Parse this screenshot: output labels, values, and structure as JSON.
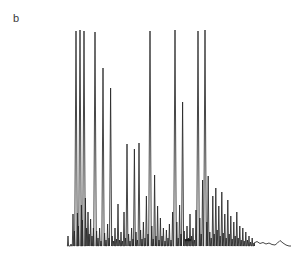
{
  "figure": {
    "panel_label": "b",
    "background_color": "#ffffff",
    "trace_color": "#262626",
    "label_color": "#3a3a3a"
  },
  "chart_data": {
    "type": "line",
    "title": "",
    "subtitle": "",
    "xlabel": "",
    "ylabel": "",
    "tick_labels_x": [],
    "tick_labels_y": [],
    "grid": false,
    "legend": [],
    "legend_position": "none",
    "axis_visible": false,
    "xlim": [
      0,
      294
    ],
    "ylim": [
      0,
      266
    ],
    "baseline_y": 246,
    "plot_left_x": 68,
    "plot_right_x": 291,
    "annotations": [
      {
        "name": "panel-letter",
        "text": "b",
        "x": 13,
        "y": 18
      }
    ],
    "artifacts": [
      {
        "name": "ink-blob",
        "x": 188,
        "y": 240,
        "rx": 3.4,
        "ry": 1.3
      }
    ],
    "peaks": [
      {
        "x": 68.0,
        "top": 236.0
      },
      {
        "x": 71.0,
        "top": 244.0
      },
      {
        "x": 73.0,
        "top": 214.0
      },
      {
        "x": 74.4,
        "top": 231.0
      },
      {
        "x": 76.0,
        "top": 31.0
      },
      {
        "x": 77.4,
        "top": 213.0
      },
      {
        "x": 78.4,
        "top": 226.0
      },
      {
        "x": 80.0,
        "top": 30.0
      },
      {
        "x": 81.4,
        "top": 205.0
      },
      {
        "x": 82.4,
        "top": 220.0
      },
      {
        "x": 84.0,
        "top": 31.0
      },
      {
        "x": 85.4,
        "top": 198.0
      },
      {
        "x": 86.6,
        "top": 228.0
      },
      {
        "x": 88.0,
        "top": 212.0
      },
      {
        "x": 89.2,
        "top": 234.0
      },
      {
        "x": 90.6,
        "top": 219.0
      },
      {
        "x": 92.0,
        "top": 236.0
      },
      {
        "x": 93.4,
        "top": 228.0
      },
      {
        "x": 95.0,
        "top": 32.0
      },
      {
        "x": 96.6,
        "top": 231.0
      },
      {
        "x": 98.0,
        "top": 238.0
      },
      {
        "x": 99.6,
        "top": 228.0
      },
      {
        "x": 101.0,
        "top": 241.0
      },
      {
        "x": 103.0,
        "top": 68.0
      },
      {
        "x": 104.6,
        "top": 233.0
      },
      {
        "x": 106.0,
        "top": 240.0
      },
      {
        "x": 107.6,
        "top": 224.0
      },
      {
        "x": 109.0,
        "top": 238.0
      },
      {
        "x": 110.6,
        "top": 88.0
      },
      {
        "x": 112.2,
        "top": 236.0
      },
      {
        "x": 113.6,
        "top": 241.0
      },
      {
        "x": 115.0,
        "top": 228.0
      },
      {
        "x": 116.6,
        "top": 239.0
      },
      {
        "x": 118.0,
        "top": 204.0
      },
      {
        "x": 119.4,
        "top": 240.0
      },
      {
        "x": 121.0,
        "top": 232.0
      },
      {
        "x": 122.4,
        "top": 241.0
      },
      {
        "x": 124.0,
        "top": 212.0
      },
      {
        "x": 125.6,
        "top": 238.0
      },
      {
        "x": 127.0,
        "top": 144.0
      },
      {
        "x": 128.6,
        "top": 234.0
      },
      {
        "x": 130.0,
        "top": 241.0
      },
      {
        "x": 131.6,
        "top": 228.0
      },
      {
        "x": 133.0,
        "top": 239.0
      },
      {
        "x": 134.4,
        "top": 149.0
      },
      {
        "x": 136.0,
        "top": 232.0
      },
      {
        "x": 137.4,
        "top": 240.0
      },
      {
        "x": 139.0,
        "top": 143.0
      },
      {
        "x": 140.6,
        "top": 230.0
      },
      {
        "x": 142.0,
        "top": 239.0
      },
      {
        "x": 143.4,
        "top": 222.0
      },
      {
        "x": 145.0,
        "top": 238.0
      },
      {
        "x": 146.4,
        "top": 196.0
      },
      {
        "x": 148.0,
        "top": 234.0
      },
      {
        "x": 150.0,
        "top": 31.0
      },
      {
        "x": 151.8,
        "top": 226.0
      },
      {
        "x": 153.2,
        "top": 239.0
      },
      {
        "x": 154.6,
        "top": 175.0
      },
      {
        "x": 156.0,
        "top": 236.0
      },
      {
        "x": 157.6,
        "top": 206.0
      },
      {
        "x": 159.0,
        "top": 240.0
      },
      {
        "x": 160.4,
        "top": 218.0
      },
      {
        "x": 162.0,
        "top": 236.0
      },
      {
        "x": 163.4,
        "top": 228.0
      },
      {
        "x": 165.0,
        "top": 241.0
      },
      {
        "x": 166.4,
        "top": 230.0
      },
      {
        "x": 168.0,
        "top": 238.0
      },
      {
        "x": 169.4,
        "top": 224.0
      },
      {
        "x": 171.0,
        "top": 240.0
      },
      {
        "x": 172.6,
        "top": 212.0
      },
      {
        "x": 175.0,
        "top": 30.0
      },
      {
        "x": 176.8,
        "top": 222.0
      },
      {
        "x": 178.2,
        "top": 238.0
      },
      {
        "x": 179.6,
        "top": 205.0
      },
      {
        "x": 181.0,
        "top": 234.0
      },
      {
        "x": 182.6,
        "top": 102.0
      },
      {
        "x": 184.2,
        "top": 231.0
      },
      {
        "x": 185.6,
        "top": 240.0
      },
      {
        "x": 187.0,
        "top": 226.0
      },
      {
        "x": 188.6,
        "top": 238.0
      },
      {
        "x": 190.0,
        "top": 214.0
      },
      {
        "x": 191.6,
        "top": 236.0
      },
      {
        "x": 193.0,
        "top": 228.0
      },
      {
        "x": 194.6,
        "top": 240.0
      },
      {
        "x": 196.0,
        "top": 210.0
      },
      {
        "x": 198.0,
        "top": 31.0
      },
      {
        "x": 199.8,
        "top": 218.0
      },
      {
        "x": 201.2,
        "top": 234.0
      },
      {
        "x": 202.6,
        "top": 180.0
      },
      {
        "x": 205.0,
        "top": 30.0
      },
      {
        "x": 206.8,
        "top": 222.0
      },
      {
        "x": 208.2,
        "top": 176.0
      },
      {
        "x": 209.8,
        "top": 232.0
      },
      {
        "x": 211.2,
        "top": 238.0
      },
      {
        "x": 212.8,
        "top": 196.0
      },
      {
        "x": 214.2,
        "top": 234.0
      },
      {
        "x": 215.8,
        "top": 188.0
      },
      {
        "x": 217.2,
        "top": 230.0
      },
      {
        "x": 218.8,
        "top": 206.0
      },
      {
        "x": 220.2,
        "top": 236.0
      },
      {
        "x": 221.8,
        "top": 192.0
      },
      {
        "x": 223.2,
        "top": 233.0
      },
      {
        "x": 224.8,
        "top": 214.0
      },
      {
        "x": 226.2,
        "top": 238.0
      },
      {
        "x": 227.8,
        "top": 200.0
      },
      {
        "x": 229.2,
        "top": 234.0
      },
      {
        "x": 230.8,
        "top": 216.0
      },
      {
        "x": 232.2,
        "top": 239.0
      },
      {
        "x": 233.8,
        "top": 222.0
      },
      {
        "x": 235.2,
        "top": 236.0
      },
      {
        "x": 236.8,
        "top": 212.0
      },
      {
        "x": 238.2,
        "top": 238.0
      },
      {
        "x": 239.8,
        "top": 226.0
      },
      {
        "x": 241.2,
        "top": 240.0
      },
      {
        "x": 242.8,
        "top": 228.0
      },
      {
        "x": 244.2,
        "top": 241.0
      },
      {
        "x": 245.8,
        "top": 232.0
      },
      {
        "x": 247.4,
        "top": 240.0
      },
      {
        "x": 249.0,
        "top": 236.0
      },
      {
        "x": 250.6,
        "top": 242.0
      },
      {
        "x": 252.2,
        "top": 238.0
      },
      {
        "x": 254.0,
        "top": 243.0
      }
    ],
    "tail": [
      {
        "x": 254.0,
        "y": 243.0
      },
      {
        "x": 257.0,
        "y": 241.5
      },
      {
        "x": 260.0,
        "y": 243.5
      },
      {
        "x": 263.0,
        "y": 242.5
      },
      {
        "x": 266.0,
        "y": 244.0
      },
      {
        "x": 269.0,
        "y": 243.0
      },
      {
        "x": 272.0,
        "y": 244.5
      },
      {
        "x": 275.0,
        "y": 245.0
      },
      {
        "x": 277.5,
        "y": 243.0
      },
      {
        "x": 280.0,
        "y": 240.5
      },
      {
        "x": 283.0,
        "y": 243.0
      },
      {
        "x": 286.0,
        "y": 245.0
      },
      {
        "x": 289.0,
        "y": 246.0
      },
      {
        "x": 291.0,
        "y": 246.0
      }
    ]
  }
}
